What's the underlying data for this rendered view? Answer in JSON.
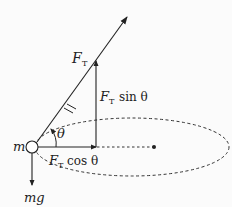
{
  "diagram": {
    "labels": {
      "mass": "m",
      "tension_F": "F",
      "tension_sub": "T",
      "angle": "θ",
      "vertical_F": "F",
      "vertical_sub": "T",
      "vertical_rest": "sin θ",
      "horizontal_F": "F",
      "horizontal_sub": "T",
      "horizontal_rest": "cos θ",
      "weight": "mg"
    },
    "elements": [
      "tension-vector",
      "vertical-component-vector",
      "horizontal-component-vector",
      "weight-vector",
      "circular-path",
      "center-point",
      "angle-arc"
    ],
    "colors": {
      "ink": "#222222",
      "background": "#fbfbfb"
    }
  }
}
